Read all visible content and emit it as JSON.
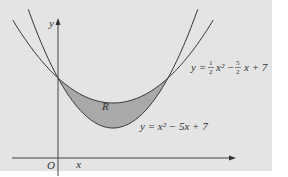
{
  "chart_data": {
    "type": "line",
    "title": "",
    "xlabel": "x",
    "ylabel": "y",
    "origin_label": "O",
    "region_label": "R",
    "series": [
      {
        "name": "y = x^2 - 5x + 7",
        "label": "y = x² − 5x + 7",
        "equation": {
          "a": 1,
          "b": -5,
          "c": 7
        }
      },
      {
        "name": "y = 1/2 x^2 - 5/2 x + 7",
        "label": "y = ½x² − 5⁄2 x + 7",
        "equation": {
          "a": 0.5,
          "b": -2.5,
          "c": 7
        }
      }
    ],
    "intersections": [
      [
        0,
        7
      ],
      [
        5,
        7
      ]
    ],
    "shaded_region": {
      "name": "R",
      "between": [
        "y = 1/2 x^2 - 5/2 x + 7",
        "y = x^2 - 5x + 7"
      ],
      "x_range": [
        0,
        5
      ]
    },
    "grid": false,
    "colors": {
      "background": "#e4e4e4",
      "region": "#a9a9a9",
      "curve": "#333333"
    }
  },
  "labels": {
    "y_axis": "y",
    "x_axis": "x",
    "origin": "O",
    "region": "R",
    "upper_eq_prefix": "y =",
    "upper_eq_frac1_num": "1",
    "upper_eq_frac1_den": "2",
    "upper_eq_mid": "x² −",
    "upper_eq_frac2_num": "5",
    "upper_eq_frac2_den": "2",
    "upper_eq_suffix": "x + 7",
    "lower_eq": "y = x² − 5x + 7"
  }
}
